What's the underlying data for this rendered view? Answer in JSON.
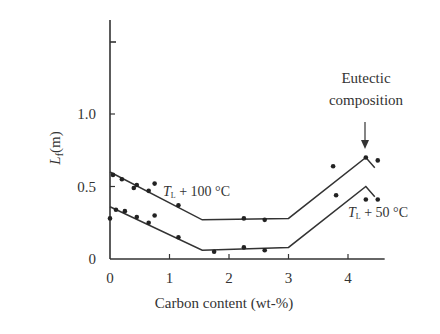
{
  "chart_data": {
    "type": "line",
    "title": "",
    "xlabel": "Carbon content (wt-%)",
    "ylabel": "L_f (m)",
    "ylabel_main": "L",
    "ylabel_sub": "f",
    "ylabel_unit": "(m)",
    "xlim": [
      0,
      4.7
    ],
    "ylim": [
      0,
      1.55
    ],
    "x_ticks": [
      0,
      1,
      2,
      3,
      4
    ],
    "x_tick_labels": [
      "0",
      "1",
      "2",
      "3",
      "4"
    ],
    "y_ticks": [
      0,
      0.5,
      1.0
    ],
    "y_tick_labels": [
      "0",
      "0.5",
      "1.0"
    ],
    "grid": false,
    "legend": "inline labels",
    "annotations": [
      {
        "text_line1": "Eutectic",
        "text_line2": "composition",
        "arrow_to_x": 4.3
      }
    ],
    "series": [
      {
        "name": "T_L + 100 °C",
        "label_main": "T",
        "label_sub": "L",
        "label_rest": " + 100 °C",
        "fit_line": {
          "x": [
            0,
            1.55,
            3.0,
            4.3,
            4.45
          ],
          "y": [
            0.6,
            0.27,
            0.28,
            0.7,
            0.63
          ]
        },
        "points": {
          "x": [
            0.05,
            0.2,
            0.4,
            0.45,
            0.65,
            0.75,
            1.15,
            2.25,
            2.6,
            3.75,
            4.3,
            4.5
          ],
          "y": [
            0.58,
            0.55,
            0.49,
            0.51,
            0.47,
            0.52,
            0.37,
            0.28,
            0.27,
            0.64,
            0.7,
            0.68
          ]
        }
      },
      {
        "name": "T_L + 50 °C",
        "label_main": "T",
        "label_sub": "L",
        "label_rest": " + 50 °C",
        "fit_line": {
          "x": [
            0,
            1.55,
            3.0,
            4.3,
            4.45
          ],
          "y": [
            0.36,
            0.06,
            0.08,
            0.5,
            0.43
          ]
        },
        "points": {
          "x": [
            0.0,
            0.1,
            0.25,
            0.45,
            0.65,
            0.75,
            1.15,
            1.75,
            2.25,
            2.6,
            3.8,
            4.3,
            4.5
          ],
          "y": [
            0.28,
            0.34,
            0.33,
            0.29,
            0.25,
            0.3,
            0.15,
            0.05,
            0.08,
            0.06,
            0.44,
            0.41,
            0.41
          ]
        }
      }
    ]
  }
}
